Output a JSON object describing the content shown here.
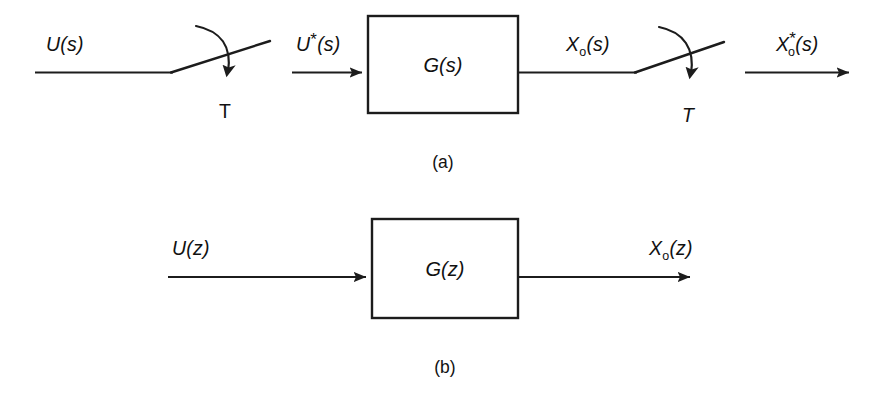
{
  "figure": {
    "background_color": "#ffffff",
    "line_color": "#1c1c1c",
    "width": 891,
    "height": 393
  },
  "panels": [
    {
      "id": "panel-a",
      "caption": "(a)",
      "description": "Continuous-domain representation with input sampler and output sampler",
      "block": {
        "label": "G(s)",
        "x": 368,
        "y": 16,
        "width": 150,
        "height": 97
      },
      "signals": [
        {
          "id": "u-s",
          "base": "U",
          "sub": "",
          "star": "",
          "arg": "(s)"
        },
        {
          "id": "u-star-s",
          "base": "U",
          "sub": "",
          "star": "*",
          "arg": "(s)"
        },
        {
          "id": "xo-s",
          "base": "X",
          "sub": "o",
          "star": "",
          "arg": "(s)"
        },
        {
          "id": "xo-star-s",
          "base": "X",
          "sub": "o",
          "star": "*",
          "arg": "(s)"
        }
      ],
      "samplers": [
        {
          "id": "sampler-input",
          "period_label": "T",
          "period_style": "upright"
        },
        {
          "id": "sampler-output",
          "period_label": "T",
          "period_style": "italic"
        }
      ]
    },
    {
      "id": "panel-b",
      "caption": "(b)",
      "description": "Equivalent discrete z-domain representation",
      "block": {
        "label": "G(z)",
        "x": 372,
        "y": 219,
        "width": 146,
        "height": 99
      },
      "signals": [
        {
          "id": "u-z",
          "base": "U",
          "sub": "",
          "star": "",
          "arg": "(z)"
        },
        {
          "id": "xo-z",
          "base": "X",
          "sub": "o",
          "star": "",
          "arg": "(z)"
        }
      ],
      "samplers": []
    }
  ]
}
